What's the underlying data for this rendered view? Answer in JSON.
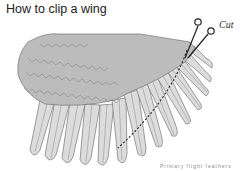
{
  "title": "How to clip a wing",
  "diagram": {
    "cut_label": "Cut",
    "caption": "Primary flight feathers",
    "colors": {
      "coverts": "#bcbcbc",
      "flight_feathers": "#dcdcdc",
      "outline": "#777777",
      "cut_line": "#222222"
    }
  }
}
